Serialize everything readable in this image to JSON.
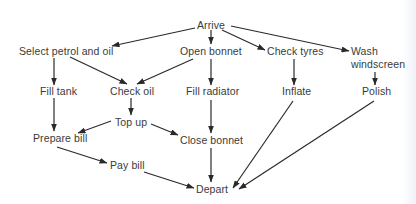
{
  "diagram": {
    "type": "activity-network",
    "nodes": [
      {
        "id": "arrive",
        "label": "Arrive",
        "x": 197,
        "y": 19
      },
      {
        "id": "select",
        "label": "Select petrol and oil",
        "x": 19,
        "y": 45
      },
      {
        "id": "open",
        "label": "Open bonnet",
        "x": 180,
        "y": 45
      },
      {
        "id": "tyres",
        "label": "Check tyres",
        "x": 267,
        "y": 45
      },
      {
        "id": "wash",
        "label": "Wash\nwindscreen",
        "x": 351,
        "y": 45
      },
      {
        "id": "filltank",
        "label": "Fill tank",
        "x": 40,
        "y": 85
      },
      {
        "id": "checkoil",
        "label": "Check oil",
        "x": 110,
        "y": 85
      },
      {
        "id": "fillrad",
        "label": "Fill radiator",
        "x": 186,
        "y": 85
      },
      {
        "id": "inflate",
        "label": "Inflate",
        "x": 282,
        "y": 85
      },
      {
        "id": "polish",
        "label": "Polish",
        "x": 362,
        "y": 85
      },
      {
        "id": "topup",
        "label": "Top up",
        "x": 115,
        "y": 116
      },
      {
        "id": "prepare",
        "label": "Prepare bill",
        "x": 33,
        "y": 132
      },
      {
        "id": "close",
        "label": "Close bonnet",
        "x": 180,
        "y": 134
      },
      {
        "id": "pay",
        "label": "Pay bill",
        "x": 110,
        "y": 159
      },
      {
        "id": "depart",
        "label": "Depart",
        "x": 196,
        "y": 183
      }
    ],
    "edges": [
      {
        "from": "arrive",
        "to": "select",
        "x1": 195,
        "y1": 28,
        "x2": 112,
        "y2": 46
      },
      {
        "from": "arrive",
        "to": "open",
        "x1": 211,
        "y1": 30,
        "x2": 211,
        "y2": 44
      },
      {
        "from": "arrive",
        "to": "tyres",
        "x1": 222,
        "y1": 30,
        "x2": 265,
        "y2": 50
      },
      {
        "from": "arrive",
        "to": "wash",
        "x1": 231,
        "y1": 26,
        "x2": 349,
        "y2": 51
      },
      {
        "from": "select",
        "to": "filltank",
        "x1": 54,
        "y1": 58,
        "x2": 54,
        "y2": 85
      },
      {
        "from": "select",
        "to": "checkoil",
        "x1": 70,
        "y1": 57,
        "x2": 127,
        "y2": 84
      },
      {
        "from": "open",
        "to": "checkoil",
        "x1": 193,
        "y1": 59,
        "x2": 137,
        "y2": 84
      },
      {
        "from": "open",
        "to": "fillrad",
        "x1": 211,
        "y1": 59,
        "x2": 211,
        "y2": 85
      },
      {
        "from": "tyres",
        "to": "inflate",
        "x1": 294,
        "y1": 59,
        "x2": 294,
        "y2": 85
      },
      {
        "from": "wash",
        "to": "polish",
        "x1": 375,
        "y1": 72,
        "x2": 375,
        "y2": 85
      },
      {
        "from": "filltank",
        "to": "prepare",
        "x1": 54,
        "y1": 98,
        "x2": 54,
        "y2": 131
      },
      {
        "from": "checkoil",
        "to": "topup",
        "x1": 131,
        "y1": 98,
        "x2": 131,
        "y2": 115
      },
      {
        "from": "topup",
        "to": "prepare",
        "x1": 111,
        "y1": 121,
        "x2": 78,
        "y2": 133
      },
      {
        "from": "topup",
        "to": "close",
        "x1": 151,
        "y1": 124,
        "x2": 178,
        "y2": 135
      },
      {
        "from": "fillrad",
        "to": "close",
        "x1": 211,
        "y1": 100,
        "x2": 211,
        "y2": 133
      },
      {
        "from": "prepare",
        "to": "pay",
        "x1": 57,
        "y1": 147,
        "x2": 107,
        "y2": 163
      },
      {
        "from": "pay",
        "to": "depart",
        "x1": 144,
        "y1": 172,
        "x2": 194,
        "y2": 188
      },
      {
        "from": "close",
        "to": "depart",
        "x1": 211,
        "y1": 148,
        "x2": 211,
        "y2": 182
      },
      {
        "from": "inflate",
        "to": "depart",
        "x1": 293,
        "y1": 101,
        "x2": 233,
        "y2": 188
      },
      {
        "from": "polish",
        "to": "depart",
        "x1": 374,
        "y1": 101,
        "x2": 239,
        "y2": 189
      }
    ],
    "colors": {
      "line": "#2a2a2a",
      "text": "#3a3a3a",
      "background": "#ffffff"
    }
  }
}
